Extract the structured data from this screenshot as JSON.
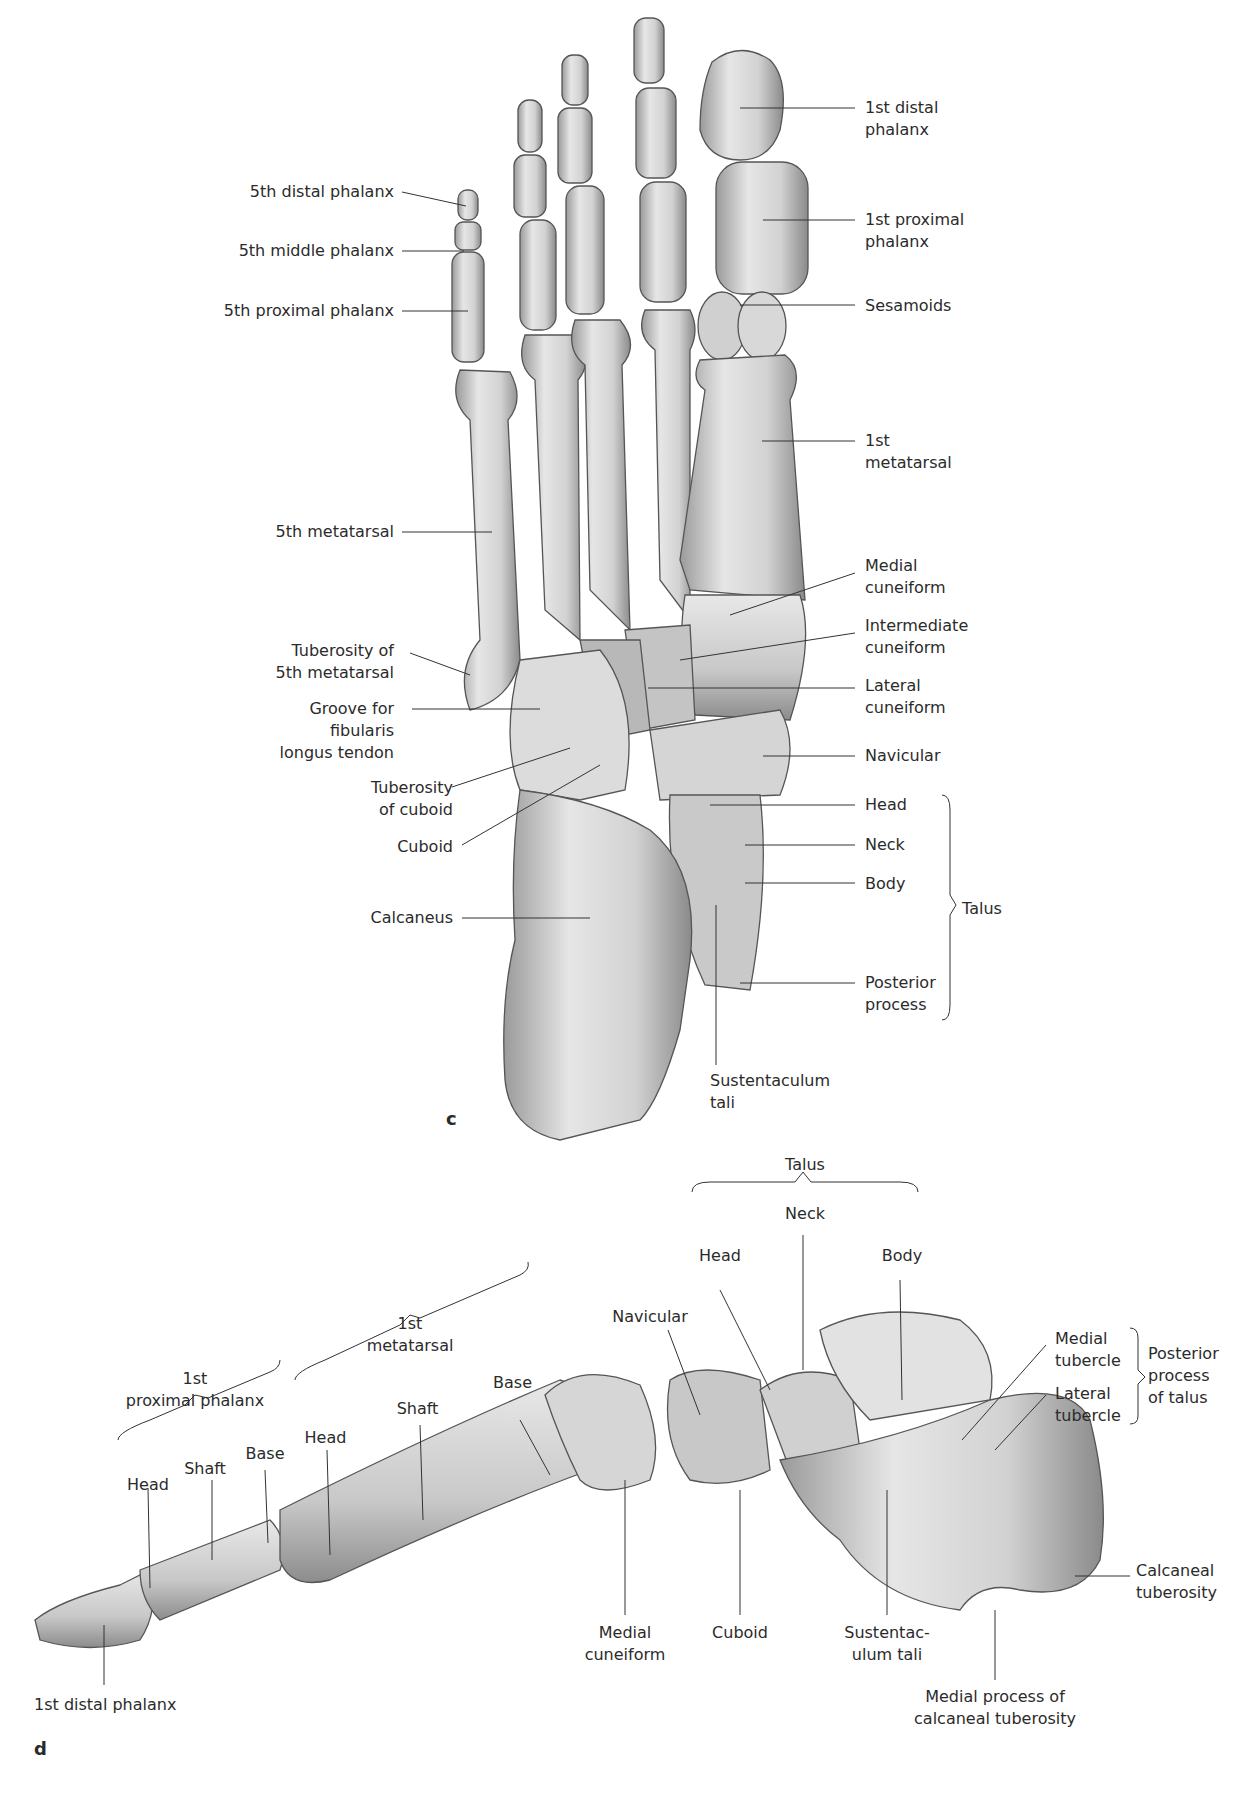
{
  "panel_c": {
    "letter": "c",
    "labels_left": {
      "distal5": "5th distal phalanx",
      "middle5": "5th middle phalanx",
      "proximal5": "5th proximal phalanx",
      "meta5": "5th metatarsal",
      "tub5_1": "Tuberosity of",
      "tub5_2": "5th metatarsal",
      "groove_1": "Groove for",
      "groove_2": "fibularis",
      "groove_3": "longus tendon",
      "tubcub_1": "Tuberosity",
      "tubcub_2": "of cuboid",
      "cuboid": "Cuboid",
      "calcaneus": "Calcaneus"
    },
    "labels_right": {
      "distal1_1": "1st distal",
      "distal1_2": "phalanx",
      "prox1_1": "1st proximal",
      "prox1_2": "phalanx",
      "sesamoids": "Sesamoids",
      "meta1_1": "1st",
      "meta1_2": "metatarsal",
      "medcun_1": "Medial",
      "medcun_2": "cuneiform",
      "intcun_1": "Intermediate",
      "intcun_2": "cuneiform",
      "latcun_1": "Lateral",
      "latcun_2": "cuneiform",
      "navicular": "Navicular",
      "head": "Head",
      "neck": "Neck",
      "body": "Body",
      "post_1": "Posterior",
      "post_2": "process",
      "talus": "Talus",
      "sust_1": "Sustentaculum",
      "sust_2": "tali"
    }
  },
  "panel_d": {
    "letter": "d",
    "talus": "Talus",
    "neck": "Neck",
    "head": "Head",
    "body": "Body",
    "navicular": "Navicular",
    "meta1_1": "1st",
    "meta1_2": "metatarsal",
    "base_meta": "Base",
    "shaft_meta": "Shaft",
    "head_meta": "Head",
    "prox1_1": "1st",
    "prox1_2": "proximal phalanx",
    "head_prox": "Head",
    "shaft_prox": "Shaft",
    "base_prox": "Base",
    "medtub_1": "Medial",
    "medtub_2": "tubercle",
    "lattub_1": "Lateral",
    "lattub_2": "tubercle",
    "postproc_1": "Posterior",
    "postproc_2": "process",
    "postproc_3": "of talus",
    "calctub_1": "Calcaneal",
    "calctub_2": "tuberosity",
    "medcun_1": "Medial",
    "medcun_2": "cuneiform",
    "cuboid": "Cuboid",
    "sust_1": "Sustentac-",
    "sust_2": "ulum tali",
    "medproc_1": "Medial process of",
    "medproc_2": "calcaneal tuberosity",
    "distal1": "1st distal phalanx"
  }
}
